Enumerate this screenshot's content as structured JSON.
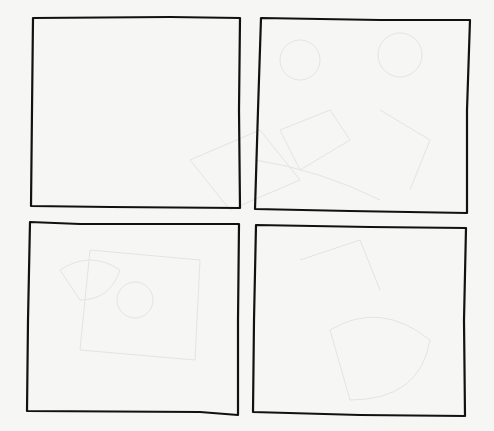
{
  "page": {
    "background": "#f6f6f5",
    "panel_fill": "#fbfbfa",
    "stroke_color": "#111111",
    "bleed_color": "#e2e2e0"
  },
  "panels": [
    {
      "id": 1,
      "points": "33,18 170,17 240,18 239,110 240,208 110,207 31,206 32,110"
    },
    {
      "id": 2,
      "points": "261,18 380,20 470,20 467,110 467,213 350,211 255,209 258,110"
    },
    {
      "id": 3,
      "points": "30,222 80,224 239,224 238,320 238,415 200,412 27,411 28,320"
    },
    {
      "id": 4,
      "points": "256,225 370,227 466,228 464,320 465,416 360,415 253,412 254,320"
    }
  ]
}
